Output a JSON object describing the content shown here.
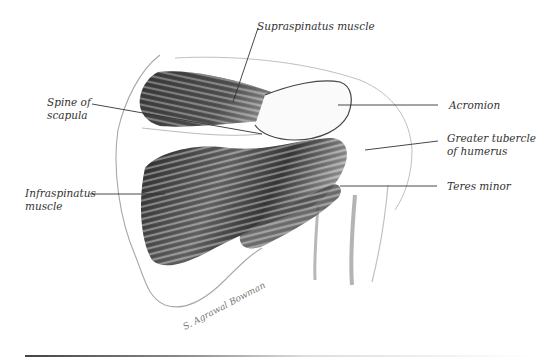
{
  "figure": {
    "labels": {
      "supraspinatus": "Supraspinatus muscle",
      "spine_line1": "Spine of",
      "spine_line2": "scapula",
      "acromion": "Acromion",
      "greater_tubercle_line1": "Greater tubercle",
      "greater_tubercle_line2": "of humerus",
      "infraspinatus_line1": "Infraspinatus",
      "infraspinatus_line2": "muscle",
      "teres_minor": "Teres minor"
    },
    "colors": {
      "muscle_dark": "#2a2a2a",
      "muscle_mid": "#7a7a7a",
      "bone_outline": "#9a9a9a",
      "leader_line": "#333333",
      "text": "#333333"
    }
  }
}
